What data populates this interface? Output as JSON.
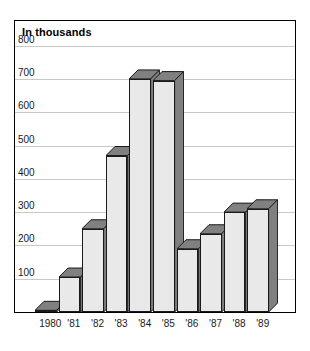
{
  "chart_data": {
    "type": "bar",
    "title": "In thousands",
    "xlabel": "",
    "ylabel": "",
    "ylim": [
      0,
      850
    ],
    "yticks": [
      100,
      200,
      300,
      400,
      500,
      600,
      700,
      800
    ],
    "ytick_labels": [
      "100",
      "200",
      "300",
      "400",
      "500",
      "600",
      "700",
      "800"
    ],
    "grid": true,
    "legend": "none",
    "style": "3d-bar",
    "colors": {
      "bar_front": "#e9e9e9",
      "bar_side": "#808080",
      "outline": "#1a1a1a",
      "gridline": "#c9c9c9",
      "frame": "#000000",
      "text": "#1a1a1a"
    },
    "categories": [
      "1980",
      "'81",
      "'82",
      "'83",
      "'84",
      "'85",
      "'86",
      "'87",
      "'88",
      "'89"
    ],
    "values": [
      5,
      105,
      250,
      470,
      700,
      695,
      190,
      235,
      300,
      310
    ]
  },
  "axis": {
    "y_labels": [
      "800",
      "700",
      "600",
      "500",
      "400",
      "300",
      "200",
      "100"
    ],
    "x_labels": [
      "1980",
      "'81",
      "'82",
      "'83",
      "'84",
      "'85",
      "'86",
      "'87",
      "'88",
      "'89"
    ]
  }
}
